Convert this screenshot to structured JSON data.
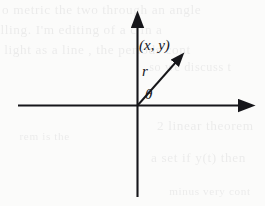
{
  "figure": {
    "type": "polar-coordinate-diagram",
    "background_color": "#fbfbfa",
    "ink_color": "#16161a",
    "width": 265,
    "height": 206
  },
  "axes": {
    "origin": {
      "x": 137,
      "y": 105
    },
    "x_axis": {
      "name": "horizontal-axis",
      "start_x": 18,
      "end_x": 248,
      "y": 105,
      "arrowhead": "right"
    },
    "y_axis": {
      "name": "vertical-axis",
      "x": 137,
      "start_y": 197,
      "end_y": 17,
      "arrowhead": "top"
    }
  },
  "ray": {
    "name": "radius-vector",
    "from": {
      "x": 137,
      "y": 105
    },
    "to": {
      "x": 183,
      "y": 54
    },
    "angle_degrees": 48,
    "arrowhead": "end"
  },
  "labels": {
    "point": "(x, y)",
    "radius": "r",
    "angle": "θ"
  },
  "background_text": {
    "description": "faint bleed-through text from reverse side of scanned page",
    "lines": [
      "o metric the two through an angle",
      "lling. I'm editing    of a  c  in a",
      "light as a line  , the periods cont",
      "so we discuss t",
      "2 linear theorem",
      "a  set if  y(t)   then",
      "minus very cont",
      "rem is the"
    ]
  }
}
